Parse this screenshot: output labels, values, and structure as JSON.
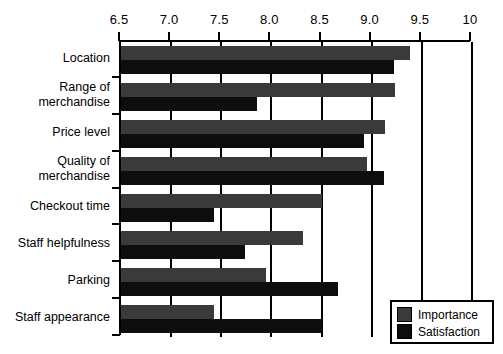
{
  "chart_data": {
    "type": "bar",
    "orientation": "horizontal",
    "title": "",
    "subtitle": "",
    "xlabel": "",
    "ylabel": "",
    "xlim": [
      6.5,
      10
    ],
    "grid": true,
    "legend_position": "bottom-right",
    "xticks": [
      "6.5",
      "7.0",
      "7.5",
      "8.0",
      "8.5",
      "9.0",
      "9.5",
      "10"
    ],
    "xtick_values": [
      6.5,
      7.0,
      7.5,
      8.0,
      8.5,
      9.0,
      9.5,
      10
    ],
    "categories": [
      "Location",
      "Range of\nmerchandise",
      "Price level",
      "Quality of\nmerchandise",
      "Checkout time",
      "Staff helpfulness",
      "Parking",
      "Staff appearance"
    ],
    "series": [
      {
        "name": "Importance",
        "color": "#3a3a3a",
        "values": [
          9.38,
          9.23,
          9.13,
          8.95,
          8.5,
          8.31,
          7.95,
          7.43
        ]
      },
      {
        "name": "Satisfaction",
        "color": "#0d0d0d",
        "values": [
          9.22,
          7.86,
          8.92,
          9.12,
          7.43,
          7.74,
          8.66,
          8.5
        ]
      }
    ]
  },
  "legend": {
    "items": [
      {
        "label": "Importance",
        "color": "#3a3a3a"
      },
      {
        "label": "Satisfaction",
        "color": "#0d0d0d"
      }
    ]
  }
}
